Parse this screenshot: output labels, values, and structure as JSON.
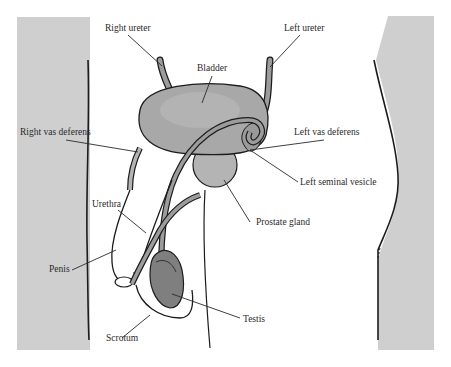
{
  "diagram": {
    "colors": {
      "body_panel": "#cfcfcf",
      "bladder": "#a8a8a8",
      "bladder_highlight": "#c4c4c4",
      "tube": "#9c9c9c",
      "testis": "#7f7f7f",
      "outline": "#1c1c1c",
      "leader": "#2a2a2a",
      "text": "#2a2a2a"
    },
    "labels": [
      {
        "id": "right-ureter",
        "text": "Right ureter"
      },
      {
        "id": "left-ureter",
        "text": "Left ureter"
      },
      {
        "id": "bladder",
        "text": "Bladder"
      },
      {
        "id": "right-vas-deferens",
        "text": "Right vas deferens"
      },
      {
        "id": "left-vas-deferens",
        "text": "Left vas deferens"
      },
      {
        "id": "left-seminal-vesicle",
        "text": "Left seminal vesicle"
      },
      {
        "id": "prostate-gland",
        "text": "Prostate gland"
      },
      {
        "id": "urethra",
        "text": "Urethra"
      },
      {
        "id": "penis",
        "text": "Penis"
      },
      {
        "id": "testis",
        "text": "Testis"
      },
      {
        "id": "scrotum",
        "text": "Scrotum"
      }
    ]
  }
}
